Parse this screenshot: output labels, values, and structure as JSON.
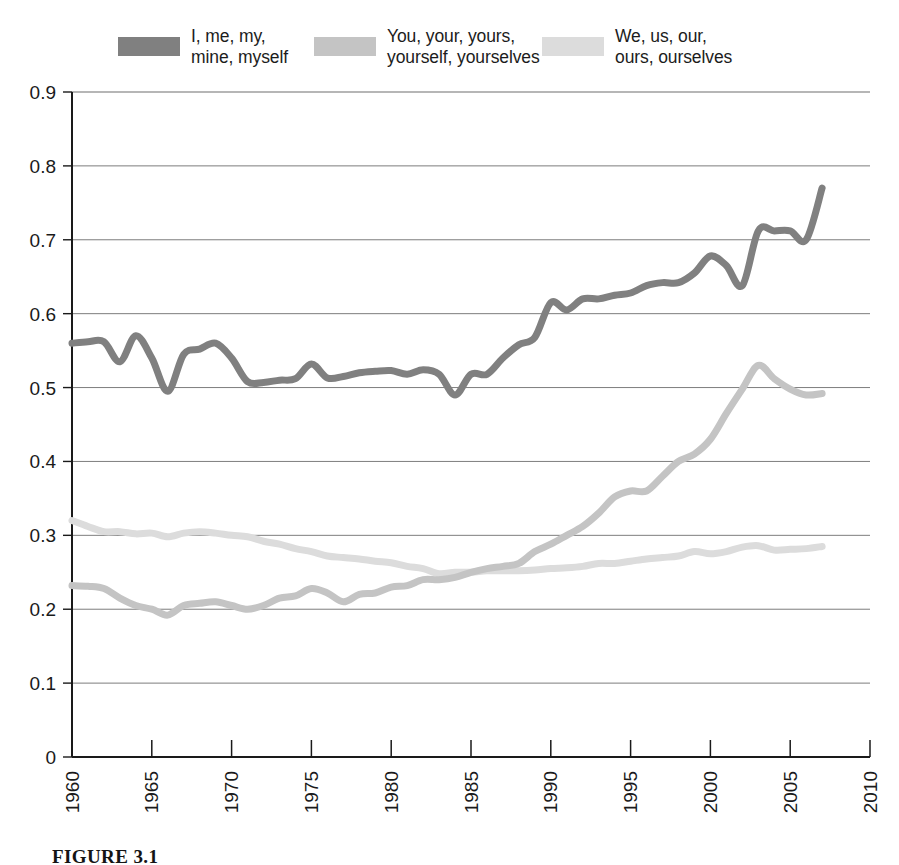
{
  "legend": {
    "entries": [
      {
        "label": "I, me, my,\nmine, myself",
        "color": "#808080",
        "swatch_name": "legend-swatch-first-person-singular"
      },
      {
        "label": "You, your, yours,\nyourself, yourselves",
        "color": "#c4c4c4",
        "swatch_name": "legend-swatch-second-person"
      },
      {
        "label": "We, us, our,\nours, ourselves",
        "color": "#dcdcdc",
        "swatch_name": "legend-swatch-first-person-plural"
      }
    ]
  },
  "caption": "FIGURE 3.1",
  "chart_data": {
    "type": "line",
    "title": "",
    "subtitle": "",
    "xlabel": "",
    "ylabel": "",
    "xlim": [
      1960,
      2010
    ],
    "ylim": [
      0,
      0.9
    ],
    "grid": true,
    "grid_axis": "y",
    "legend_position": "top",
    "xticks": [
      1960,
      1965,
      1970,
      1975,
      1980,
      1985,
      1990,
      1995,
      2000,
      2005,
      2010
    ],
    "xtick_labels": [
      "1960",
      "1965",
      "1970",
      "1975",
      "1980",
      "1985",
      "1990",
      "1995",
      "2000",
      "2005",
      "2010"
    ],
    "xtick_label_rotation": -90,
    "yticks": [
      0,
      0.1,
      0.2,
      0.3,
      0.4,
      0.5,
      0.6,
      0.7,
      0.8,
      0.9
    ],
    "ytick_labels": [
      "0",
      "0.1",
      "0.2",
      "0.3",
      "0.4",
      "0.5",
      "0.6",
      "0.7",
      "0.8",
      "0.9"
    ],
    "x": [
      1960,
      1961,
      1962,
      1963,
      1964,
      1965,
      1966,
      1967,
      1968,
      1969,
      1970,
      1971,
      1972,
      1973,
      1974,
      1975,
      1976,
      1977,
      1978,
      1979,
      1980,
      1981,
      1982,
      1983,
      1984,
      1985,
      1986,
      1987,
      1988,
      1989,
      1990,
      1991,
      1992,
      1993,
      1994,
      1995,
      1996,
      1997,
      1998,
      1999,
      2000,
      2001,
      2002,
      2003,
      2004,
      2005,
      2006,
      2007
    ],
    "series": [
      {
        "name": "I, me, my, mine, myself",
        "color": "#808080",
        "values": [
          0.56,
          0.562,
          0.562,
          0.535,
          0.57,
          0.54,
          0.495,
          0.545,
          0.552,
          0.56,
          0.54,
          0.508,
          0.507,
          0.51,
          0.512,
          0.532,
          0.513,
          0.515,
          0.52,
          0.522,
          0.523,
          0.518,
          0.524,
          0.518,
          0.49,
          0.518,
          0.518,
          0.54,
          0.558,
          0.568,
          0.615,
          0.605,
          0.62,
          0.62,
          0.625,
          0.628,
          0.638,
          0.642,
          0.642,
          0.655,
          0.678,
          0.665,
          0.638,
          0.712,
          0.712,
          0.712,
          0.7,
          0.77
        ]
      },
      {
        "name": "You, your, yours, yourself, yourselves",
        "color": "#c4c4c4",
        "values": [
          0.232,
          0.231,
          0.228,
          0.215,
          0.205,
          0.2,
          0.192,
          0.205,
          0.208,
          0.21,
          0.205,
          0.2,
          0.205,
          0.215,
          0.218,
          0.228,
          0.222,
          0.21,
          0.22,
          0.222,
          0.23,
          0.232,
          0.24,
          0.24,
          0.243,
          0.25,
          0.255,
          0.258,
          0.262,
          0.278,
          0.288,
          0.3,
          0.312,
          0.33,
          0.352,
          0.36,
          0.36,
          0.38,
          0.4,
          0.41,
          0.43,
          0.465,
          0.498,
          0.53,
          0.512,
          0.498,
          0.49,
          0.492
        ]
      },
      {
        "name": "We, us, our, ours, ourselves",
        "color": "#dcdcdc",
        "values": [
          0.32,
          0.312,
          0.305,
          0.305,
          0.302,
          0.303,
          0.298,
          0.303,
          0.305,
          0.303,
          0.3,
          0.298,
          0.292,
          0.288,
          0.282,
          0.278,
          0.272,
          0.27,
          0.268,
          0.265,
          0.263,
          0.258,
          0.255,
          0.248,
          0.25,
          0.25,
          0.252,
          0.252,
          0.252,
          0.253,
          0.255,
          0.256,
          0.258,
          0.262,
          0.262,
          0.265,
          0.268,
          0.27,
          0.272,
          0.278,
          0.275,
          0.278,
          0.284,
          0.286,
          0.28,
          0.281,
          0.282,
          0.285
        ]
      }
    ]
  }
}
